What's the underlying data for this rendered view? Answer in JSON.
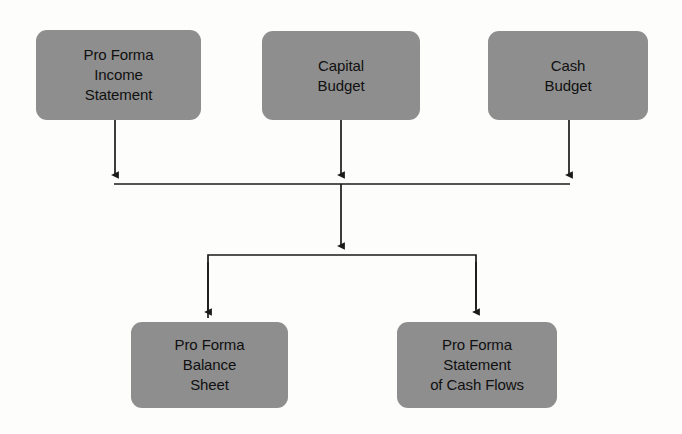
{
  "diagram": {
    "type": "flowchart",
    "colors": {
      "background": "#fdfdfb",
      "node_fill": "#8e8e8e",
      "node_text": "#101010",
      "connector": "#1a1a1a"
    },
    "nodes": [
      {
        "id": "pro-forma-income-statement",
        "lines": [
          "Pro Forma",
          "Income",
          "Statement"
        ],
        "row": "top"
      },
      {
        "id": "capital-budget",
        "lines": [
          "Capital",
          "Budget"
        ],
        "row": "top"
      },
      {
        "id": "cash-budget",
        "lines": [
          "Cash",
          "Budget"
        ],
        "row": "top"
      },
      {
        "id": "pro-forma-balance-sheet",
        "lines": [
          "Pro Forma",
          "Balance",
          "Sheet"
        ],
        "row": "bottom"
      },
      {
        "id": "pro-forma-statement-of-cash-flows",
        "lines": [
          "Pro Forma",
          "Statement",
          "of Cash Flows"
        ],
        "row": "bottom"
      }
    ],
    "edges": [
      {
        "from": "pro-forma-income-statement",
        "to": "merge-bus-upper"
      },
      {
        "from": "capital-budget",
        "to": "merge-bus-upper"
      },
      {
        "from": "cash-budget",
        "to": "merge-bus-upper"
      },
      {
        "from": "merge-bus-upper",
        "to": "split-bus-lower"
      },
      {
        "from": "split-bus-lower",
        "to": "pro-forma-balance-sheet"
      },
      {
        "from": "split-bus-lower",
        "to": "pro-forma-statement-of-cash-flows"
      }
    ]
  }
}
